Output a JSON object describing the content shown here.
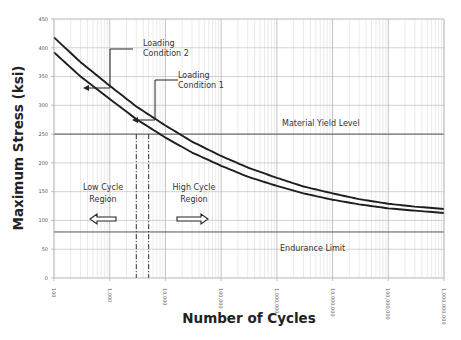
{
  "chart_data": {
    "type": "line",
    "title": "",
    "xlabel": "Number of Cycles",
    "ylabel": "Maximum Stress (ksi)",
    "xscale": "log",
    "xlim": [
      100,
      1000000000
    ],
    "ylim": [
      0,
      450
    ],
    "grid": true,
    "y_ticks": [
      0,
      50,
      100,
      150,
      200,
      250,
      300,
      350,
      400,
      450
    ],
    "y_tick_labels": [
      "0",
      "50",
      "100",
      "150",
      "200",
      "250",
      "300",
      "350",
      "400",
      "450"
    ],
    "x_ticks": [
      100,
      1000,
      10000,
      100000,
      1000000,
      10000000,
      100000000,
      1000000000
    ],
    "x_tick_labels": [
      "100",
      "1,000",
      "10,000",
      "100,000",
      "1,000,000",
      "10,000,000",
      "100,000,000",
      "1,000,000,000"
    ],
    "x": [
      100,
      300,
      1000,
      3000,
      10000,
      30000,
      100000,
      300000,
      1000000,
      3000000,
      10000000,
      30000000,
      100000000,
      300000000,
      1000000000
    ],
    "series": [
      {
        "name": "Loading Condition 2",
        "values": [
          418,
          375,
          334,
          298,
          265,
          237,
          212,
          192,
          174,
          159,
          147,
          137,
          129,
          124,
          120
        ]
      },
      {
        "name": "Loading Condition 1",
        "values": [
          392,
          350,
          311,
          276,
          244,
          218,
          195,
          176,
          160,
          147,
          136,
          128,
          121,
          117,
          113
        ]
      }
    ],
    "reference_lines": [
      {
        "name": "Material Yield Level",
        "y": 250
      },
      {
        "name": "Endurance Limit",
        "y": 80
      }
    ],
    "vertical_markers": [
      {
        "name": "Loading Condition 1 yield crossing",
        "x": 3000,
        "style": "dash-dot"
      },
      {
        "name": "Loading Condition 2 yield crossing",
        "x": 5000,
        "style": "dash-dot"
      }
    ],
    "annotations": [
      {
        "text": "Loading Condition 2",
        "target": "upper curve"
      },
      {
        "text": "Loading Condition 1",
        "target": "lower curve"
      },
      {
        "text": "Material Yield Level"
      },
      {
        "text": "Endurance Limit"
      },
      {
        "text": "Low Cycle Region",
        "arrow": "left"
      },
      {
        "text": "High Cycle Region",
        "arrow": "right"
      }
    ]
  },
  "labels": {
    "xlabel": "Number of Cycles",
    "ylabel": "Maximum Stress (ksi)",
    "yield": "Material Yield Level",
    "endurance": "Endurance Limit",
    "lc2_line1": "Loading",
    "lc2_line2": "Condition 2",
    "lc1_line1": "Loading",
    "lc1_line2": "Condition 1",
    "low_line1": "Low Cycle",
    "low_line2": "Region",
    "high_line1": "High Cycle",
    "high_line2": "Region"
  }
}
